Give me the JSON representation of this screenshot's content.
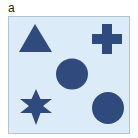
{
  "figure": {
    "panel_label": "a",
    "background_color": "#dcebf8",
    "border_color": "#b7c3cf",
    "shape_color": "#2f4a7c",
    "shapes": [
      {
        "type": "triangle",
        "name": "triangle-shape"
      },
      {
        "type": "cross",
        "name": "cross-shape"
      },
      {
        "type": "circle",
        "name": "circle-shape-center"
      },
      {
        "type": "star",
        "name": "star-shape",
        "points": 6
      },
      {
        "type": "circle",
        "name": "circle-shape-bottom-right"
      }
    ]
  }
}
